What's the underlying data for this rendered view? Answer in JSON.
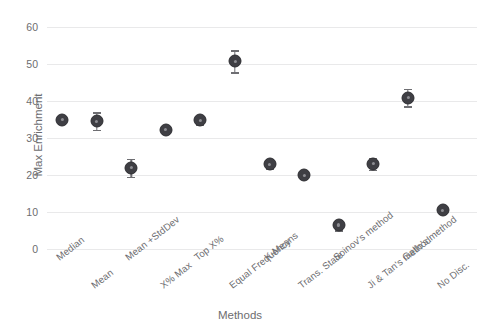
{
  "chart_data": {
    "type": "scatter",
    "title": "",
    "xlabel": "Methods",
    "ylabel": "Max Enrichment",
    "ylim": [
      0,
      62
    ],
    "yticks": [
      0,
      10,
      20,
      30,
      40,
      50,
      60
    ],
    "grid": true,
    "legend": "none",
    "categories": [
      "Median",
      "Mean",
      "Mean +StdDev",
      "X% Max",
      "Top X%",
      "Equal Frequency",
      "K-Means",
      "Trans. State",
      "Soinov's method",
      "Ji & Tan's method",
      "Gallo's method",
      "No Disc."
    ],
    "series": [
      {
        "name": "Max Enrichment",
        "values": [
          35.0,
          34.6,
          22.0,
          32.3,
          34.9,
          50.8,
          23.0,
          20.0,
          6.5,
          23.1,
          41.0,
          10.5
        ],
        "errors": [
          0.0,
          2.4,
          2.4,
          0.0,
          1.2,
          3.0,
          1.3,
          0.0,
          1.4,
          1.6,
          2.4,
          0.0
        ]
      }
    ],
    "marker_color": "#3f3f44",
    "errorbar_color": "#6e6e72",
    "grid_color": "#e9e9ea",
    "text_color": "#6d6d70"
  },
  "axis": {
    "ylabel": "Max Enrichment",
    "xlabel": "Methods"
  }
}
